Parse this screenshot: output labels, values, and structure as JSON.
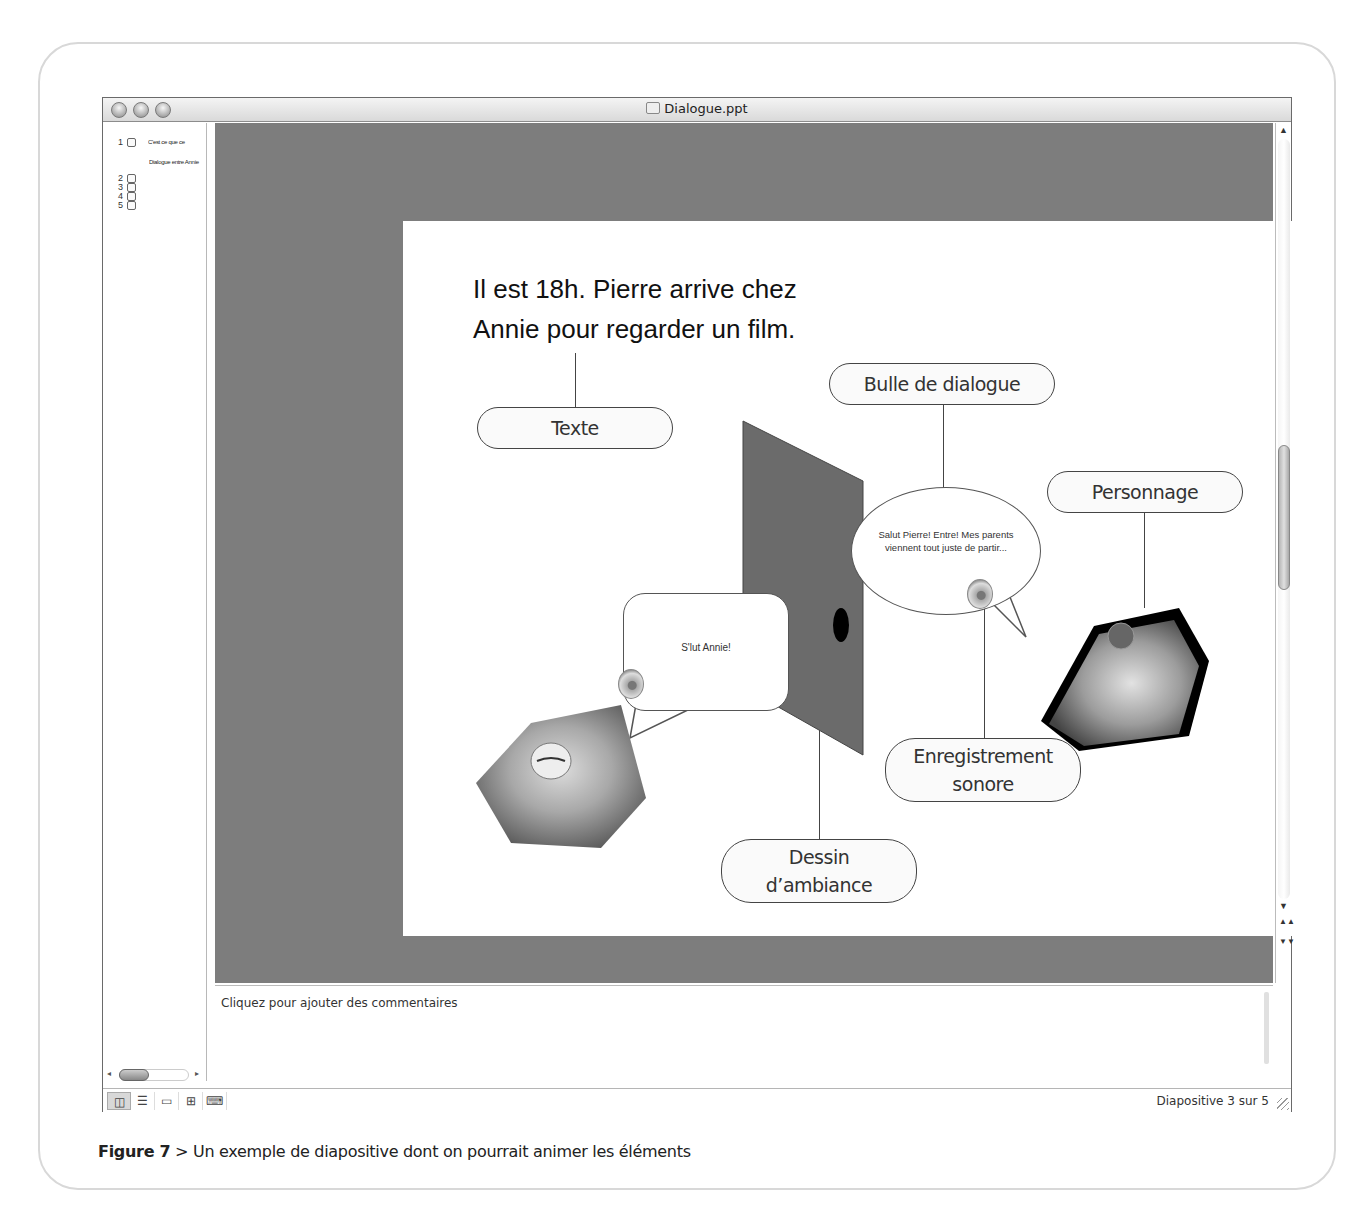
{
  "window": {
    "title": "Dialogue.ppt",
    "traffic_lights": [
      "close",
      "minimize",
      "zoom"
    ]
  },
  "sidebar": {
    "slides": [
      {
        "number": "1",
        "text": "C'est ce que ce",
        "subtext": "Dialogue entre Annie"
      },
      {
        "number": "2",
        "text": ""
      },
      {
        "number": "3",
        "text": ""
      },
      {
        "number": "4",
        "text": ""
      },
      {
        "number": "5",
        "text": ""
      }
    ],
    "hscroll": {
      "left_arrow": "◂",
      "right_arrow": "▸"
    }
  },
  "slide": {
    "title_line1": "Il est 18h. Pierre arrive chez",
    "title_line2": "Annie pour regarder un film.",
    "callouts": {
      "texte": "Texte",
      "bulle": "Bulle de dialogue",
      "personnage": "Personnage",
      "enregistrement_line1": "Enregistrement",
      "enregistrement_line2": "sonore",
      "dessin_line1": "Dessin",
      "dessin_line2": "d’ambiance"
    },
    "bubble_pierre": "S'lut Annie!",
    "bubble_annie_line1": "Salut Pierre! Entre! Mes parents",
    "bubble_annie_line2": "viennent tout juste de partir..."
  },
  "scrollbar": {
    "up": "▲",
    "down": "▼",
    "page_up": "▲▲",
    "page_down": "▼▼"
  },
  "notes": {
    "placeholder": "Cliquez pour ajouter des commentaires"
  },
  "statusbar": {
    "views": [
      {
        "name": "normal",
        "glyph": "◫",
        "active": true
      },
      {
        "name": "outline",
        "glyph": "☰",
        "active": false
      },
      {
        "name": "slide",
        "glyph": "▭",
        "active": false
      },
      {
        "name": "sorter",
        "glyph": "⊞",
        "active": false
      },
      {
        "name": "slideshow",
        "glyph": "⌨",
        "active": false
      }
    ],
    "slide_counter": "Diapositive 3 sur 5"
  },
  "caption": {
    "label": "Figure 7",
    "separator": " > ",
    "text": "Un exemple de diapositive dont on pourrait animer les éléments"
  }
}
